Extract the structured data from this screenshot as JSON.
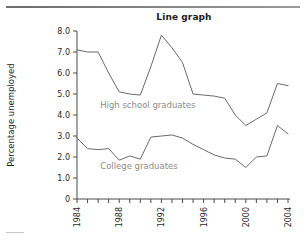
{
  "figure": {
    "title": "Line graph",
    "top_rule": "horizontal-rule",
    "bottom_rule": "horizontal-rule"
  },
  "chart_data": {
    "type": "line",
    "title": "Line graph",
    "xlabel": "",
    "ylabel": "Percentage unemployed",
    "xlim": [
      1984,
      2004
    ],
    "ylim": [
      0,
      8
    ],
    "grid": false,
    "legend_position": "inline-annotation",
    "x": [
      1984,
      1985,
      1986,
      1987,
      1988,
      1989,
      1990,
      1991,
      1992,
      1993,
      1994,
      1995,
      1996,
      1997,
      1998,
      1999,
      2000,
      2001,
      2002,
      2003,
      2004
    ],
    "x_tick_labels": [
      "1984",
      "1988",
      "1992",
      "1996",
      "2000",
      "2004"
    ],
    "x_tick_values": [
      1984,
      1988,
      1992,
      1996,
      2000,
      2004
    ],
    "y_tick_labels": [
      "0",
      "1.0",
      "2.0",
      "3.0",
      "4.0",
      "5.0",
      "6.0",
      "7.0",
      "8.0"
    ],
    "y_tick_values": [
      0,
      1,
      2,
      3,
      4,
      5,
      6,
      7,
      8
    ],
    "series": [
      {
        "name": "High school graduates",
        "color": "#6a6a6a",
        "label_x": 1986.2,
        "label_y": 4.35,
        "values": [
          7.1,
          7.0,
          7.0,
          6.0,
          5.1,
          5.0,
          4.95,
          6.3,
          7.8,
          7.2,
          6.5,
          5.0,
          4.95,
          4.9,
          4.8,
          4.0,
          3.5,
          3.8,
          4.1,
          5.5,
          5.4
        ]
      },
      {
        "name": "College graduates",
        "color": "#8f8f8f",
        "label_x": 1986.2,
        "label_y": 1.45,
        "values": [
          2.9,
          2.4,
          2.35,
          2.4,
          1.85,
          2.05,
          1.9,
          2.95,
          3.0,
          3.05,
          2.9,
          2.6,
          2.35,
          2.1,
          1.95,
          1.9,
          1.5,
          2.0,
          2.05,
          3.5,
          3.1
        ]
      }
    ]
  }
}
